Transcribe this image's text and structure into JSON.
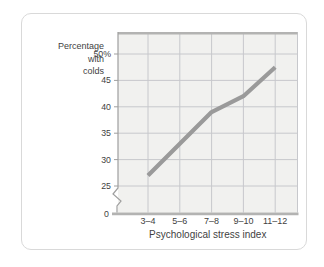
{
  "card": {
    "background": "#ffffff",
    "border_color": "#d9d9d9"
  },
  "chart_data": {
    "type": "line",
    "title": "",
    "ylabel_lines": [
      "Percentage",
      "with",
      "colds"
    ],
    "xlabel": "Psychological stress index",
    "categories": [
      "3–4",
      "5–6",
      "7–8",
      "9–10",
      "11–12"
    ],
    "values": [
      27,
      33,
      39,
      42,
      47.5
    ],
    "y_axis": {
      "ticks": [
        25,
        30,
        35,
        40,
        45,
        50
      ],
      "tick_labels": [
        "25",
        "30",
        "35",
        "40",
        "45",
        "50%"
      ],
      "origin_label": "0",
      "has_axis_break": true,
      "axis_break_between": [
        0,
        25
      ]
    },
    "grid": true,
    "legend": "none",
    "colors": {
      "line": "#9a9a9a",
      "grid": "#c7c8cc",
      "plot_bg": "#f1f1ef",
      "axis": "#b3b3b2",
      "y_axis_line": "#9f9f9f",
      "text": "#3f3f3f"
    }
  }
}
